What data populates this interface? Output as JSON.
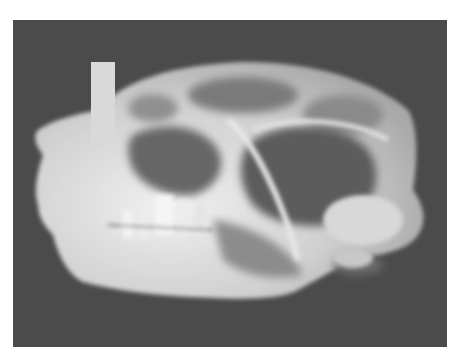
{
  "image": {
    "subject": "x-ray radiograph of animal skull, lateral view",
    "colors": {
      "page_background": "#ffffff",
      "photo_background": "#4b4b4b",
      "bone_highlight": "#e8e8e8",
      "bone_mid": "#bdbdbd",
      "cavity_dark": "#5a5a5a",
      "label_tag": "#d9d9d9"
    }
  }
}
